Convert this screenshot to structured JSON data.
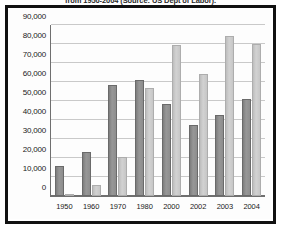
{
  "caption": "from 1950-2004 (Source: US Dept of Labor).",
  "chart_data": {
    "type": "bar",
    "title": "from 1950-2004 (Source: US Dept of Labor).",
    "xlabel": "",
    "ylabel": "",
    "ylim": [
      0,
      90000
    ],
    "ytick_values": [
      90000,
      80000,
      70000,
      60000,
      50000,
      40000,
      30000,
      20000,
      10000,
      0
    ],
    "ytick_labels": [
      "90,000",
      "80,000",
      "70,000",
      "60,000",
      "50,000",
      "40,000",
      "30,000",
      "20,000",
      "10,000",
      "0"
    ],
    "grid": true,
    "legend": "none",
    "categories": [
      "1950",
      "1960",
      "1970",
      "1980",
      "2000",
      "2002",
      "2003",
      "2004"
    ],
    "series": [
      {
        "name": "series-1",
        "color": "#8d8d8d",
        "values": [
          16000,
          23000,
          58500,
          61000,
          48500,
          37500,
          42500,
          51000
        ]
      },
      {
        "name": "series-2",
        "color": "#c6c6c6",
        "values": [
          1000,
          6000,
          20500,
          57000,
          79500,
          64000,
          84000,
          80000
        ]
      }
    ]
  }
}
